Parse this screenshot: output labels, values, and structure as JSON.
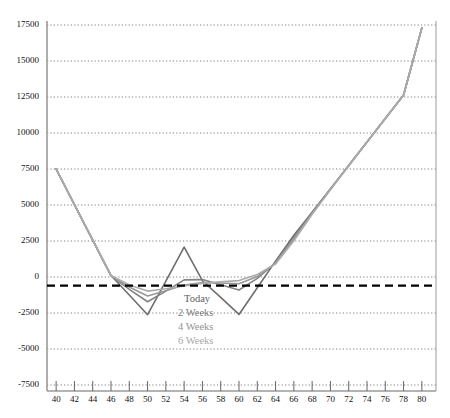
{
  "chart_data": {
    "type": "line",
    "title": "",
    "subtitle": "",
    "xlabel": "",
    "ylabel": "",
    "xlim": [
      39,
      81
    ],
    "ylim": [
      -7500,
      17500
    ],
    "grid": true,
    "grid_axis": "y",
    "legend_position": "inside-center-lower",
    "x_ticks": [
      40,
      42,
      44,
      46,
      48,
      50,
      52,
      54,
      56,
      58,
      60,
      62,
      64,
      66,
      68,
      70,
      72,
      74,
      76,
      78,
      80
    ],
    "y_ticks": [
      17500,
      15000,
      12500,
      10000,
      7500,
      5000,
      2500,
      0,
      -2500,
      -5000,
      -7500
    ],
    "reference_line": {
      "name": "zero-reference",
      "value": -600,
      "style": "dashed",
      "color": "#000000",
      "width": 2.2
    },
    "x": [
      40,
      42,
      44,
      46,
      48,
      50,
      52,
      54,
      56,
      58,
      60,
      62,
      64,
      66,
      68,
      70,
      72,
      74,
      76,
      78,
      80
    ],
    "series": [
      {
        "name": "Today",
        "color": "#6e6e6e",
        "width": 1.6,
        "values": [
          7500,
          5020,
          2560,
          100,
          -1250,
          -2620,
          -280,
          2080,
          -260,
          -1420,
          -2600,
          -750,
          1100,
          2900,
          4500,
          6120,
          7750,
          9380,
          11010,
          12640,
          17300
        ]
      },
      {
        "name": "2 Weeks",
        "color": "#838383",
        "width": 1.6,
        "values": [
          7500,
          5020,
          2560,
          100,
          -860,
          -1720,
          -980,
          -200,
          -180,
          -540,
          -900,
          -100,
          1000,
          2750,
          4500,
          6120,
          7750,
          9380,
          11010,
          12640,
          17300
        ]
      },
      {
        "name": "4 Weeks",
        "color": "#989898",
        "width": 1.6,
        "values": [
          7500,
          5020,
          2560,
          100,
          -700,
          -1320,
          -960,
          -560,
          -380,
          -420,
          -470,
          40,
          950,
          2640,
          4420,
          6090,
          7740,
          9380,
          11010,
          12640,
          17300
        ]
      },
      {
        "name": "6 Weeks",
        "color": "#ababab",
        "width": 1.6,
        "values": [
          7500,
          5020,
          2560,
          100,
          -560,
          -980,
          -820,
          -620,
          -440,
          -330,
          -250,
          180,
          900,
          2520,
          4350,
          6060,
          7730,
          9370,
          11010,
          12640,
          17300
        ]
      }
    ],
    "legend": [
      {
        "label": "Today",
        "color": "#5c5c5c"
      },
      {
        "label": "2 Weeks",
        "color": "#7d7d7d"
      },
      {
        "label": "4 Weeks",
        "color": "#949494"
      },
      {
        "label": "6 Weeks",
        "color": "#a8a8a8"
      }
    ],
    "axis_color": "#9a9a9a",
    "grid_color": "#707070",
    "tick_label_color": "#111111"
  }
}
